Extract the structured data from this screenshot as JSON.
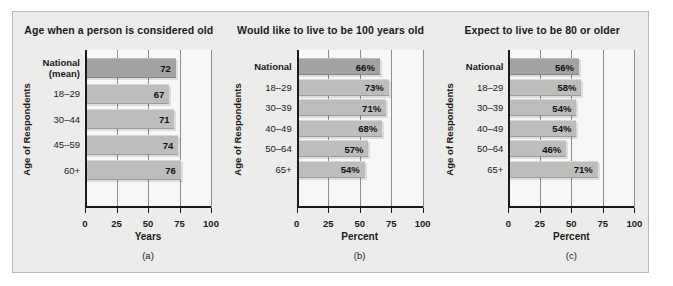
{
  "figure": {
    "background_color": "#ececeb",
    "border_color": "#b9b9b7",
    "bar_color": "#bdbdbb",
    "bar_national_color": "#a3a3a1",
    "axis_color": "#1a1a1a"
  },
  "chart_data": [
    {
      "type": "bar",
      "orientation": "horizontal",
      "title": "Age when a person is considered old",
      "caption": "(a)",
      "xlabel": "Years",
      "ylabel": "Age of Respondents",
      "xlim": [
        0,
        100
      ],
      "xticks": [
        0,
        25,
        50,
        75,
        100
      ],
      "xtick_labels": [
        "0",
        "25",
        "50",
        "75",
        "100"
      ],
      "grid": true,
      "legend": "none",
      "categories": [
        "National (mean)",
        "18–29",
        "30–44",
        "45–59",
        "60+"
      ],
      "category_lines": [
        [
          "National",
          "(mean)"
        ],
        [
          "18–29"
        ],
        [
          "30–44"
        ],
        [
          "45–59"
        ],
        [
          "60+"
        ]
      ],
      "values": [
        72,
        67,
        71,
        74,
        76
      ],
      "value_labels": [
        "72",
        "67",
        "71",
        "74",
        "76"
      ]
    },
    {
      "type": "bar",
      "orientation": "horizontal",
      "title": "Would like to live to be 100 years old",
      "caption": "(b)",
      "xlabel": "Percent",
      "ylabel": "Age of Respondents",
      "xlim": [
        0,
        100
      ],
      "xticks": [
        0,
        25,
        50,
        75,
        100
      ],
      "xtick_labels": [
        "0",
        "25",
        "50",
        "75",
        "100"
      ],
      "grid": true,
      "legend": "none",
      "categories": [
        "National",
        "18–29",
        "30–39",
        "40–49",
        "50–64",
        "65+"
      ],
      "category_lines": [
        [
          "National"
        ],
        [
          "18–29"
        ],
        [
          "30–39"
        ],
        [
          "40–49"
        ],
        [
          "50–64"
        ],
        [
          "65+"
        ]
      ],
      "values": [
        66,
        73,
        71,
        68,
        57,
        54
      ],
      "value_labels": [
        "66%",
        "73%",
        "71%",
        "68%",
        "57%",
        "54%"
      ]
    },
    {
      "type": "bar",
      "orientation": "horizontal",
      "title": "Expect to live to be 80 or older",
      "caption": "(c)",
      "xlabel": "Percent",
      "ylabel": "Age of Respondents",
      "xlim": [
        0,
        100
      ],
      "xticks": [
        0,
        25,
        50,
        75,
        100
      ],
      "xtick_labels": [
        "0",
        "25",
        "50",
        "75",
        "100"
      ],
      "grid": true,
      "legend": "none",
      "categories": [
        "National",
        "18–29",
        "30–39",
        "40–49",
        "50–64",
        "65+"
      ],
      "category_lines": [
        [
          "National"
        ],
        [
          "18–29"
        ],
        [
          "30–39"
        ],
        [
          "40–49"
        ],
        [
          "50–64"
        ],
        [
          "65+"
        ]
      ],
      "values": [
        56,
        58,
        54,
        54,
        46,
        71
      ],
      "value_labels": [
        "56%",
        "58%",
        "54%",
        "54%",
        "46%",
        "71%"
      ]
    }
  ]
}
